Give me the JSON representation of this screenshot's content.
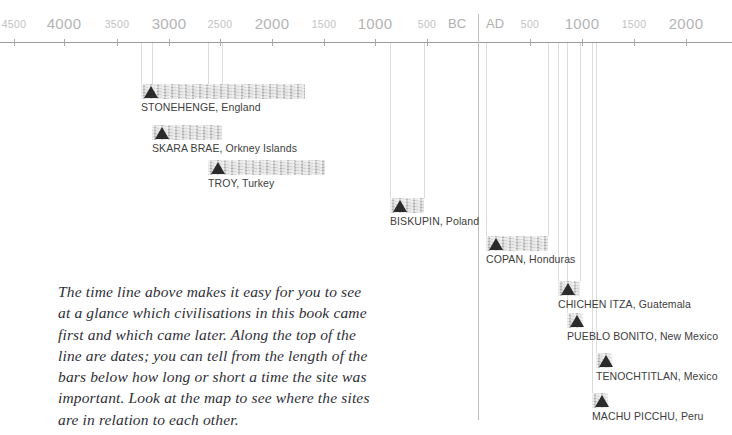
{
  "axis": {
    "line_y": 42,
    "era_divider": {
      "label_bc": "BC",
      "label_ad": "AD",
      "x": 478,
      "top": 14,
      "bottom": 420
    },
    "ticks": [
      {
        "label": "4500",
        "x": 14,
        "size": "minor"
      },
      {
        "label": "4000",
        "x": 64,
        "size": "major"
      },
      {
        "label": "3500",
        "x": 117,
        "size": "minor"
      },
      {
        "label": "3000",
        "x": 169,
        "size": "major"
      },
      {
        "label": "2500",
        "x": 220,
        "size": "minor"
      },
      {
        "label": "2000",
        "x": 272,
        "size": "major"
      },
      {
        "label": "1500",
        "x": 324,
        "size": "minor"
      },
      {
        "label": "1000",
        "x": 375,
        "size": "major"
      },
      {
        "label": "500",
        "x": 427,
        "size": "minor"
      },
      {
        "label": "500",
        "x": 530,
        "size": "minor"
      },
      {
        "label": "1000",
        "x": 582,
        "size": "major"
      },
      {
        "label": "1500",
        "x": 634,
        "size": "minor"
      },
      {
        "label": "2000",
        "x": 686,
        "size": "major"
      }
    ]
  },
  "sites": [
    {
      "name": "STONEHENGE, England",
      "x": 141,
      "y": 84,
      "width": 164,
      "drop_lines": [
        141,
        152,
        208,
        222
      ]
    },
    {
      "name": "SKARA BRAE, Orkney Islands",
      "x": 152,
      "y": 125,
      "width": 70,
      "drop_lines": []
    },
    {
      "name": "TROY, Turkey",
      "x": 208,
      "y": 160,
      "width": 117,
      "drop_lines": []
    },
    {
      "name": "BISKUPIN, Poland",
      "x": 390,
      "y": 198,
      "width": 34,
      "drop_lines": [
        390,
        424
      ]
    },
    {
      "name": "COPAN, Honduras",
      "x": 486,
      "y": 236,
      "width": 62,
      "drop_lines": [
        486,
        548
      ]
    },
    {
      "name": "CHICHEN ITZA, Guatemala",
      "x": 558,
      "y": 281,
      "width": 22,
      "drop_lines": [
        558,
        580
      ]
    },
    {
      "name": "PUEBLO BONITO, New Mexico",
      "x": 567,
      "y": 313,
      "width": 16,
      "drop_lines": [
        567
      ]
    },
    {
      "name": "TENOCHTITLAN, Mexico",
      "x": 596,
      "y": 353,
      "width": 16,
      "drop_lines": [
        596
      ]
    },
    {
      "name": "MACHU PICCHU, Peru",
      "x": 592,
      "y": 393,
      "width": 16,
      "drop_lines": [
        592
      ]
    }
  ],
  "caption": {
    "text": "The time line above makes it easy for you to see\nat a glance which civilisations in this book came\nfirst and which came later. Along the top of the\nline are dates; you can tell from the length of the\nbars below how long or short a time the site was\nimportant. Look at the map to see where the sites\nare in relation to each other."
  },
  "colors": {
    "bar": "#cfcfcf",
    "marker": "#2b2b2b",
    "axis": "#9a9a9a",
    "tick_text": "#b9b9b9",
    "label_text": "#3d3d3d",
    "caption_text": "#2f2f38",
    "drop_line": "#dcdcdc"
  }
}
